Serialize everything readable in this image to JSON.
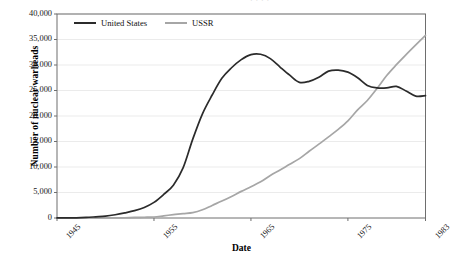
{
  "chart_data": {
    "type": "line",
    "title": "",
    "xlabel": "Date",
    "ylabel": "Number of nuclear warheads",
    "xlim": [
      1945,
      1983
    ],
    "ylim": [
      0,
      40000
    ],
    "grid": true,
    "legend_position": "top-left-inside",
    "xticks": [
      "1945",
      "1955",
      "1965",
      "1975",
      "1983"
    ],
    "xtick_values": [
      1945,
      1955,
      1965,
      1975,
      1983
    ],
    "yticks": [
      "0",
      "5,000",
      "10,000",
      "15,000",
      "20,000",
      "25,000",
      "30,000",
      "35,000",
      "40,000"
    ],
    "ytick_values": [
      0,
      5000,
      10000,
      15000,
      20000,
      25000,
      30000,
      35000,
      40000
    ],
    "x": [
      1945,
      1946,
      1947,
      1948,
      1949,
      1950,
      1951,
      1952,
      1953,
      1954,
      1955,
      1956,
      1957,
      1958,
      1959,
      1960,
      1961,
      1962,
      1963,
      1964,
      1965,
      1966,
      1967,
      1968,
      1969,
      1970,
      1971,
      1972,
      1973,
      1974,
      1975,
      1976,
      1977,
      1978,
      1979,
      1980,
      1981,
      1982,
      1983
    ],
    "series": [
      {
        "name": "United States",
        "color": "#2b2b2b",
        "values": [
          6,
          11,
          32,
          110,
          235,
          369,
          640,
          1005,
          1436,
          2063,
          3057,
          4618,
          6444,
          9822,
          15468,
          20434,
          24111,
          27387,
          29459,
          31056,
          32040,
          32100,
          31255,
          29600,
          28000,
          26600,
          26800,
          27600,
          28800,
          29000,
          28600,
          27500,
          26000,
          25500,
          25500,
          25800,
          24900,
          23900,
          24000
        ]
      },
      {
        "name": "USSR",
        "color": "#a6a6a6",
        "values": [
          0,
          0,
          0,
          0,
          1,
          5,
          25,
          50,
          120,
          150,
          200,
          426,
          660,
          869,
          1060,
          1605,
          2471,
          3322,
          4238,
          5221,
          6129,
          7089,
          8339,
          9399,
          10538,
          11643,
          13092,
          14478,
          15915,
          17385,
          19055,
          21205,
          23044,
          25393,
          27935,
          30062,
          32049,
          33952,
          35804
        ]
      }
    ]
  },
  "axes": {
    "y_title": "Number of nuclear warheads",
    "x_title": "Date"
  },
  "legend": {
    "items": [
      {
        "label": "United States",
        "color": "#2b2b2b"
      },
      {
        "label": "USSR",
        "color": "#a6a6a6"
      }
    ]
  },
  "artifacts": {
    "top_cut_text": "· · · ·"
  }
}
